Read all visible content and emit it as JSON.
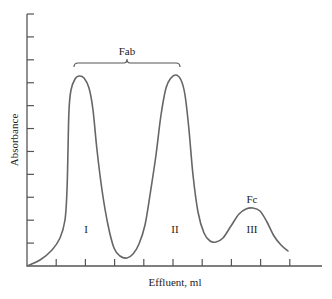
{
  "chart_data": {
    "type": "line",
    "title": "",
    "xlabel": "Effluent, ml",
    "ylabel": "Absorbance",
    "x_ticks": 9,
    "y_ticks": 11,
    "grid": false,
    "legend": null,
    "peaks": [
      {
        "label": "I",
        "x_rel": 0.18,
        "height_rel": 0.76
      },
      {
        "label": "II",
        "x_rel": 0.52,
        "height_rel": 0.76
      },
      {
        "label": "III",
        "x_rel": 0.78,
        "height_rel": 0.23
      }
    ],
    "annotations": [
      {
        "text": "Fab",
        "spans_peaks": [
          "I",
          "II"
        ]
      },
      {
        "text": "Fc",
        "peak": "III"
      }
    ],
    "curve_points": [
      [
        27,
        266
      ],
      [
        40,
        260
      ],
      [
        52,
        250
      ],
      [
        60,
        238
      ],
      [
        65,
        220
      ],
      [
        67,
        190
      ],
      [
        68,
        150
      ],
      [
        69,
        110
      ],
      [
        71,
        90
      ],
      [
        75,
        79
      ],
      [
        79,
        76
      ],
      [
        84,
        78
      ],
      [
        89,
        88
      ],
      [
        93,
        110
      ],
      [
        97,
        150
      ],
      [
        102,
        190
      ],
      [
        108,
        225
      ],
      [
        114,
        248
      ],
      [
        120,
        256
      ],
      [
        127,
        258
      ],
      [
        133,
        254
      ],
      [
        139,
        244
      ],
      [
        145,
        225
      ],
      [
        150,
        195
      ],
      [
        156,
        155
      ],
      [
        161,
        115
      ],
      [
        166,
        88
      ],
      [
        171,
        78
      ],
      [
        176,
        75
      ],
      [
        181,
        80
      ],
      [
        185,
        95
      ],
      [
        189,
        130
      ],
      [
        193,
        175
      ],
      [
        198,
        212
      ],
      [
        204,
        233
      ],
      [
        210,
        241
      ],
      [
        216,
        242
      ],
      [
        223,
        238
      ],
      [
        231,
        226
      ],
      [
        239,
        214
      ],
      [
        246,
        209
      ],
      [
        253,
        208
      ],
      [
        260,
        211
      ],
      [
        267,
        222
      ],
      [
        274,
        236
      ],
      [
        281,
        245
      ],
      [
        288,
        251
      ]
    ]
  },
  "labels": {
    "x_axis": "Effluent, ml",
    "y_axis": "Absorbance",
    "brace": "Fab",
    "fc": "Fc",
    "peak1": "I",
    "peak2": "II",
    "peak3": "III"
  }
}
